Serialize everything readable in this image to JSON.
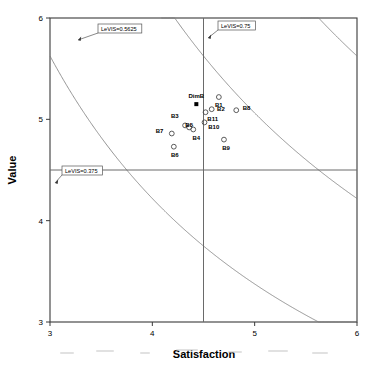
{
  "chart_data": {
    "type": "scatter",
    "title": "",
    "xlabel": "Satisfaction",
    "ylabel": "Value",
    "xlim": [
      3,
      6
    ],
    "ylim": [
      3,
      6
    ],
    "xticks": [
      "3",
      "4",
      "5",
      "6"
    ],
    "yticks": [
      "3",
      "4",
      "5",
      "6"
    ],
    "xtick_values": [
      3,
      4,
      5,
      6
    ],
    "ytick_values": [
      3,
      4,
      5,
      6
    ],
    "grid": false,
    "legend": "none",
    "crosshair": {
      "x": 4.5,
      "y": 4.5
    },
    "points": [
      {
        "label": "B1",
        "x": 4.65,
        "y": 5.22,
        "label_dx": 0,
        "label_dy": -0.1
      },
      {
        "label": "B2",
        "x": 4.58,
        "y": 5.1,
        "label_dx": 0.09,
        "label_dy": -0.02
      },
      {
        "label": "B3",
        "x": 4.32,
        "y": 4.94,
        "label_dx": -0.1,
        "label_dy": 0.07
      },
      {
        "label": "B4",
        "x": 4.4,
        "y": 4.9,
        "label_dx": 0.03,
        "label_dy": -0.1
      },
      {
        "label": "B5",
        "x": 4.36,
        "y": 4.92,
        "label_dx": 0.0,
        "label_dy": 0.0
      },
      {
        "label": "B6",
        "x": 4.21,
        "y": 4.73,
        "label_dx": 0.01,
        "label_dy": -0.1
      },
      {
        "label": "B7",
        "x": 4.19,
        "y": 4.86,
        "label_dx": -0.12,
        "label_dy": 0.01
      },
      {
        "label": "B8",
        "x": 4.82,
        "y": 5.09,
        "label_dx": 0.1,
        "label_dy": 0.0
      },
      {
        "label": "B9",
        "x": 4.7,
        "y": 4.8,
        "label_dx": 0.02,
        "label_dy": -0.1
      },
      {
        "label": "B10",
        "x": 4.51,
        "y": 4.97,
        "label_dx": 0.09,
        "label_dy": -0.07
      },
      {
        "label": "B11",
        "x": 4.52,
        "y": 5.07,
        "label_dx": 0.07,
        "label_dy": -0.09
      }
    ],
    "centroid": {
      "label": "DimB",
      "x": 4.43,
      "y": 5.15,
      "marker": "filled-square"
    },
    "iso_curves": [
      {
        "label": "LeVIS=0.5625",
        "constant": 25.3125
      },
      {
        "label": "LeVIS=0.75",
        "constant": 33.75
      },
      {
        "label": "LeVIS=0.375",
        "constant": 16.875
      }
    ],
    "annotations": [
      {
        "name": "levis-0-5625",
        "text": "LeVIS=0.5625",
        "box_x": 98,
        "box_y": 24,
        "arrow_x": 78,
        "arrow_y": 40
      },
      {
        "name": "levis-0-75",
        "text": "LeVIS=0.75",
        "box_x": 218,
        "box_y": 21,
        "arrow_x": 208,
        "arrow_y": 38
      },
      {
        "name": "levis-0-375",
        "text": "LeVIS=0.375",
        "box_x": 62,
        "box_y": 166,
        "arrow_x": 55,
        "arrow_y": 183
      }
    ]
  },
  "axes": {
    "x_title": "Satisfaction",
    "y_title": "Value"
  }
}
